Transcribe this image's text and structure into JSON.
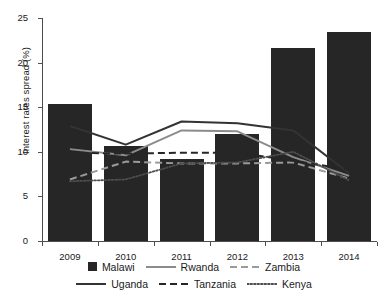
{
  "chart_data": {
    "type": "bar",
    "title": "",
    "xlabel": "",
    "ylabel": "Interest rates spread (%)",
    "categories": [
      "2009",
      "2010",
      "2011",
      "2012",
      "2013",
      "2014"
    ],
    "ylim": [
      0,
      25
    ],
    "yticks": [
      0,
      5,
      10,
      15,
      20,
      25
    ],
    "grid": false,
    "legend_position": "bottom",
    "series": [
      {
        "name": "Malawi",
        "render": "bar",
        "color": "#262626",
        "values": [
          15.4,
          10.6,
          9.2,
          12.0,
          21.6,
          23.4
        ]
      },
      {
        "name": "Rwanda",
        "render": "line-solid",
        "color": "#8c8c8c",
        "values": [
          10.3,
          9.6,
          12.4,
          12.3,
          9.4,
          7.3
        ]
      },
      {
        "name": "Zambia",
        "render": "line-dashed",
        "color": "#9a9a9a",
        "values": [
          6.9,
          8.9,
          8.7,
          8.7,
          8.8,
          7.0
        ]
      },
      {
        "name": "Uganda",
        "render": "line-solid",
        "color": "#333333",
        "values": [
          12.9,
          10.8,
          13.4,
          13.2,
          12.4,
          7.6
        ]
      },
      {
        "name": "Tanzania",
        "render": "line-dashed",
        "color": "#262626",
        "values": [
          9.9,
          9.8,
          9.9,
          9.9,
          9.0,
          8.0
        ]
      },
      {
        "name": "Kenya",
        "render": "line-dotted",
        "color": "#4d4d4d",
        "values": [
          6.7,
          6.9,
          8.7,
          8.8,
          10.0,
          6.8
        ]
      }
    ]
  },
  "axis": {
    "y_tick_labels": [
      "0",
      "5",
      "10",
      "15",
      "20",
      "25"
    ],
    "x_tick_labels": [
      "2009",
      "2010",
      "2011",
      "2012",
      "2013",
      "2014"
    ],
    "y_title": "Interest rates spread (%)"
  },
  "legend": {
    "row1": [
      {
        "label": "Malawi",
        "key": "square-swatch"
      },
      {
        "label": "Rwanda",
        "key": "solid-gray-line"
      },
      {
        "label": "Zambia",
        "key": "dashed-gray-line"
      }
    ],
    "row2": [
      {
        "label": "Uganda",
        "key": "solid-black-line"
      },
      {
        "label": "Tanzania",
        "key": "dashed-black-line"
      },
      {
        "label": "Kenya",
        "key": "dotted-line"
      }
    ]
  }
}
